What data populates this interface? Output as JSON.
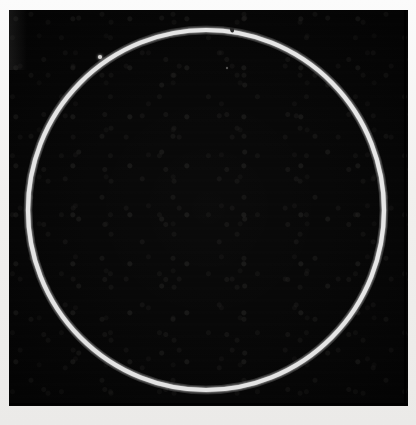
{
  "image": {
    "kind": "astronomical-plate",
    "caption": "",
    "alt_text": "Bright white circular ring outline on a black background",
    "background_color": "#050505",
    "paper_color": "#f3f2f0",
    "ring_color": "#ffffff"
  },
  "plate": {
    "label": "",
    "left": 9,
    "top": 10,
    "width": 399,
    "height": 396
  },
  "chart_data": {
    "type": "scatter",
    "title": "",
    "subtitle": "",
    "xlabel": "",
    "ylabel": "",
    "grid": false,
    "legend": "none",
    "xlim": [
      0,
      399
    ],
    "ylim": [
      0,
      396
    ],
    "annotations": [
      {
        "name": "ring-outline",
        "shape": "circle",
        "cx": 206,
        "cy": 210,
        "r": 178,
        "stroke_width": 4,
        "color": "#ffffff"
      },
      {
        "name": "ring-gap-top",
        "position_deg": 272,
        "arc_deg": 3
      },
      {
        "name": "ring-gap-right",
        "position_deg": 345,
        "arc_deg": 4
      },
      {
        "name": "point-source",
        "x": 100,
        "y": 57,
        "radius": 2,
        "color": "#f0f0ee"
      },
      {
        "name": "faint-speck",
        "x": 227,
        "y": 68,
        "radius": 1,
        "color": "#6e6c6a"
      }
    ]
  },
  "ring": {
    "cx": 206,
    "cy": 210,
    "rx": 178,
    "ry": 180,
    "stroke_width": 4.2,
    "color": "#ffffff"
  },
  "markers": [
    {
      "name": "point-source",
      "cx": 100,
      "cy": 57,
      "r": 2.1,
      "color": "#eeedeb",
      "glow": 5
    },
    {
      "name": "faint-speck",
      "cx": 227,
      "cy": 68,
      "r": 1.2,
      "color": "#5a5856",
      "glow": 0
    }
  ],
  "gaps": [
    {
      "name": "ring-gap-top",
      "cx": 232,
      "cy": 29,
      "w": 4,
      "h": 7
    },
    {
      "name": "ring-gap-right",
      "cx": 381,
      "cy": 135,
      "w": 7,
      "h": 5
    }
  ]
}
